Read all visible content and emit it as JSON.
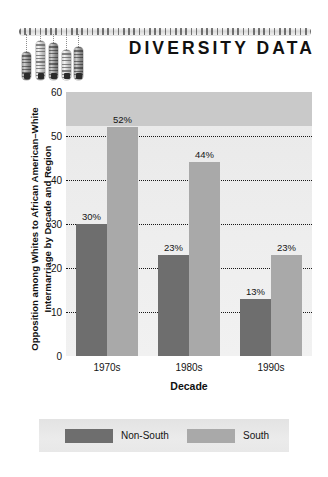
{
  "header": {
    "title": "DIVERSITY DATA",
    "logo": {
      "name": "diversity-data-logo",
      "bar_count": 5
    }
  },
  "chart_data": {
    "type": "bar",
    "title": "",
    "categories": [
      "1970s",
      "1980s",
      "1990s"
    ],
    "series": [
      {
        "name": "Non-South",
        "color": "#6e6e6e",
        "values": [
          30,
          23,
          13
        ],
        "labels": [
          "30%",
          "23%",
          "13%"
        ]
      },
      {
        "name": "South",
        "color": "#a9a9a9",
        "values": [
          52,
          44,
          23
        ],
        "labels": [
          "52%",
          "44%",
          "23%"
        ]
      }
    ],
    "xlabel": "Decade",
    "ylabel_lines": [
      "Opposition among Whites to African American–White",
      "Intermarriage by Decade and Region"
    ],
    "ylim": [
      0,
      60
    ],
    "yticks": [
      0,
      10,
      20,
      30,
      40,
      50,
      60
    ],
    "ytick_labels": [
      "0",
      "10",
      "20",
      "30",
      "40",
      "50",
      "60"
    ],
    "grid": true,
    "grid_style": "dotted",
    "legend_position": "bottom",
    "plot_background": "#eeeeee"
  },
  "legend": {
    "entries": [
      {
        "label": "Non-South",
        "color": "#6e6e6e"
      },
      {
        "label": "South",
        "color": "#a9a9a9"
      }
    ]
  }
}
